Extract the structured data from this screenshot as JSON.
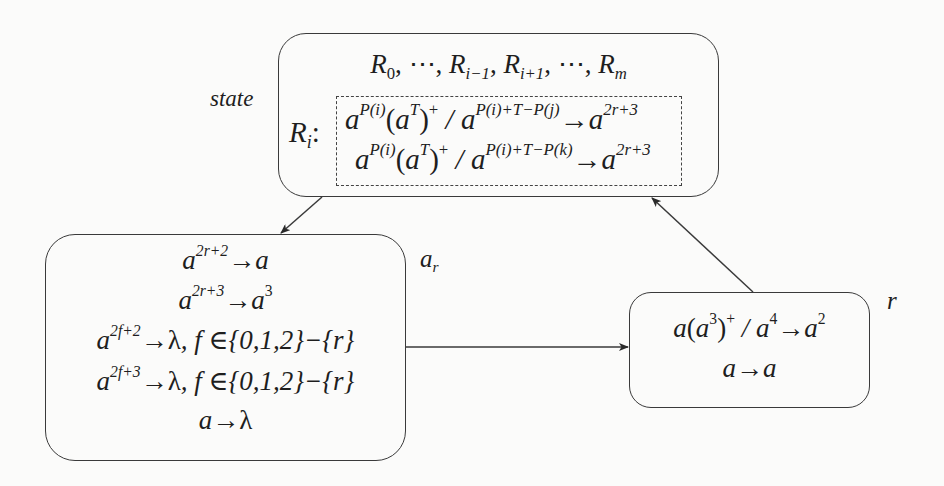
{
  "diagram": {
    "state_label": "state",
    "top_box": {
      "header": {
        "parts": [
          "R",
          "0",
          ", ⋯, ",
          "R",
          "i−1",
          ", ",
          "R",
          "i+1",
          ", ⋯, ",
          "R",
          "m"
        ]
      },
      "ri_label": "R",
      "ri_sub": "i",
      "ri_colon": ":",
      "rule1": {
        "base1": "a",
        "sup1": "P(i)",
        "paren_open": "(",
        "base2": "a",
        "sup2": "T",
        "paren_close": ")",
        "plus": "+",
        "slash": " / ",
        "base3": "a",
        "sup3": "P(i)+T−P(j)",
        "arrow": "→",
        "base4": "a",
        "sup4": "2r+3"
      },
      "rule2": {
        "base1": "a",
        "sup1": "P(i)",
        "paren_open": "(",
        "base2": "a",
        "sup2": "T",
        "paren_close": ")",
        "plus": "+",
        "slash": " / ",
        "base3": "a",
        "sup3": "P(i)+T−P(k)",
        "arrow": "→",
        "base4": "a",
        "sup4": "2r+3"
      }
    },
    "left_box": {
      "rules": [
        {
          "lhs": "a",
          "lhs_sup": "2r+2",
          "arrow": "→",
          "rhs": "a",
          "rhs_sup": "",
          "cond": ""
        },
        {
          "lhs": "a",
          "lhs_sup": "2r+3",
          "arrow": "→",
          "rhs": "a",
          "rhs_sup": "3",
          "cond": ""
        },
        {
          "lhs": "a",
          "lhs_sup": "2f+2",
          "arrow": "→",
          "rhs": "λ",
          "rhs_sup": "",
          "cond": ", f ∈{0,1,2}−{r}"
        },
        {
          "lhs": "a",
          "lhs_sup": "2f+3",
          "arrow": "→",
          "rhs": "λ",
          "rhs_sup": "",
          "cond": ", f ∈{0,1,2}−{r}"
        },
        {
          "lhs": "a",
          "lhs_sup": "",
          "arrow": "→",
          "rhs": "λ",
          "rhs_sup": "",
          "cond": ""
        }
      ]
    },
    "right_box": {
      "rule1": {
        "a": "a",
        "open": "(",
        "a2": "a",
        "sup2": "3",
        "close": ")",
        "plus": "+",
        "slash": " / ",
        "a3": "a",
        "sup3": "4",
        "arrow": "→",
        "a4": "a",
        "sup4": "2"
      },
      "rule2": {
        "lhs": "a",
        "arrow": "→",
        "rhs": "a"
      }
    },
    "edge_labels": {
      "ar_base": "a",
      "ar_sub": "r",
      "r": "r"
    },
    "colors": {
      "stroke": "#3a3a3a",
      "background": "#fbfbfa",
      "text": "#1e1e1e"
    }
  }
}
